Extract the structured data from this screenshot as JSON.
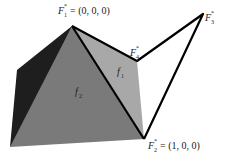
{
  "diagram": {
    "type": "polyhedron-faces",
    "vertices": {
      "F1": {
        "label": "F",
        "sub": "1",
        "sup": "*",
        "coord": "= (0, 0, 0)"
      },
      "F2": {
        "label": "F",
        "sub": "2",
        "sup": "*",
        "coord": "= (1, 0, 0)"
      },
      "F3": {
        "label": "F",
        "sub": "3",
        "sup": "*"
      },
      "F4": {
        "label": "F",
        "sub": "4",
        "sup": "*"
      }
    },
    "faces": {
      "f1": {
        "label": "f",
        "sub": "1"
      },
      "f2": {
        "label": "f",
        "sub": "2"
      }
    },
    "colors": {
      "dark_face": "#1e1e1e",
      "f2_face": "#7a7a7a",
      "f1_face": "#a8a8a8",
      "edge": "#000000"
    }
  }
}
